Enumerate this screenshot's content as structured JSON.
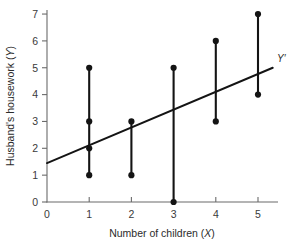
{
  "chart_data": {
    "type": "scatter",
    "title": "",
    "subtitle": "",
    "xlabel": "Number of children (X)",
    "xlabel_plain": "Number of children (",
    "xlabel_var": "X",
    "xlabel_close": ")",
    "ylabel": "Husband's housework (Y)",
    "ylabel_plain": "Husband's housework (",
    "ylabel_var": "Y",
    "ylabel_close": ")",
    "xlim": [
      0,
      5.6
    ],
    "ylim": [
      0,
      7.3
    ],
    "xticks": [
      0,
      1,
      2,
      3,
      4,
      5
    ],
    "yticks": [
      0,
      1,
      2,
      3,
      4,
      5,
      6,
      7
    ],
    "xtick_labels": [
      "0",
      "1",
      "2",
      "3",
      "4",
      "5"
    ],
    "ytick_labels": [
      "0",
      "1",
      "2",
      "3",
      "4",
      "5",
      "6",
      "7"
    ],
    "grid": false,
    "legend": "none",
    "point_color": "#141414",
    "line_color": "#141414",
    "axis_color": "#6b6b6b",
    "background": "#ffffff",
    "points": [
      {
        "x": 1,
        "y": 1
      },
      {
        "x": 1,
        "y": 2
      },
      {
        "x": 1,
        "y": 3
      },
      {
        "x": 1,
        "y": 5
      },
      {
        "x": 2,
        "y": 1
      },
      {
        "x": 2,
        "y": 3
      },
      {
        "x": 3,
        "y": 0
      },
      {
        "x": 3,
        "y": 5
      },
      {
        "x": 4,
        "y": 3
      },
      {
        "x": 4,
        "y": 6
      },
      {
        "x": 5,
        "y": 4
      },
      {
        "x": 5,
        "y": 7
      }
    ],
    "stems": [
      {
        "x": 1,
        "y_low": 1,
        "y_high": 5
      },
      {
        "x": 2,
        "y_low": 1,
        "y_high": 3
      },
      {
        "x": 3,
        "y_low": 0,
        "y_high": 5
      },
      {
        "x": 4,
        "y_low": 3,
        "y_high": 6
      },
      {
        "x": 5,
        "y_low": 4,
        "y_high": 7
      }
    ],
    "regression": {
      "label": "Y′",
      "intercept": 1.45,
      "slope": 0.7,
      "x_start": 0,
      "x_end": 5.35,
      "y_start": 1.45,
      "y_end": 5.0
    },
    "annotations": [
      {
        "name": "regression-line-label",
        "text": "Y′",
        "x": 5.45,
        "y": 5.25
      }
    ]
  }
}
